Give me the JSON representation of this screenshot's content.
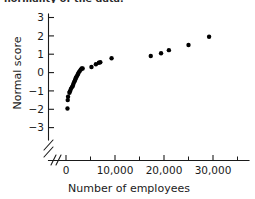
{
  "caption_fragment": "normality of the data.",
  "chart_data": {
    "type": "scatter",
    "title": "",
    "xlabel": "Number of employees",
    "ylabel": "Normal score",
    "xlim": [
      0,
      32000
    ],
    "ylim": [
      -3.6,
      3.4
    ],
    "grid": false,
    "legend": null,
    "axis_break_x": true,
    "axis_break_y": true,
    "x_ticks": [
      0,
      10000,
      20000,
      30000
    ],
    "x_ticklabels": [
      "0",
      "10,000",
      "20,000",
      "30,000"
    ],
    "x_minor_ticks": [
      5000,
      15000,
      25000
    ],
    "y_ticks": [
      -3,
      -2,
      -1,
      0,
      1,
      2,
      3
    ],
    "y_ticklabels": [
      "−3",
      "−2",
      "−1",
      "0",
      "1",
      "2",
      "3"
    ],
    "marker": "filled-circle",
    "marker_color": "#000000",
    "points": [
      {
        "x": 300,
        "y": -1.96
      },
      {
        "x": 350,
        "y": -1.5
      },
      {
        "x": 420,
        "y": -1.32
      },
      {
        "x": 700,
        "y": -1.1
      },
      {
        "x": 800,
        "y": -1.02
      },
      {
        "x": 1000,
        "y": -0.9
      },
      {
        "x": 1200,
        "y": -0.8
      },
      {
        "x": 1400,
        "y": -0.72
      },
      {
        "x": 1500,
        "y": -0.62
      },
      {
        "x": 1650,
        "y": -0.52
      },
      {
        "x": 1800,
        "y": -0.45
      },
      {
        "x": 1900,
        "y": -0.38
      },
      {
        "x": 2000,
        "y": -0.3
      },
      {
        "x": 2150,
        "y": -0.23
      },
      {
        "x": 2300,
        "y": -0.16
      },
      {
        "x": 2450,
        "y": -0.08
      },
      {
        "x": 2600,
        "y": 0.0
      },
      {
        "x": 2800,
        "y": 0.08
      },
      {
        "x": 3000,
        "y": 0.16
      },
      {
        "x": 3200,
        "y": 0.22
      },
      {
        "x": 3400,
        "y": 0.22
      },
      {
        "x": 5200,
        "y": 0.3
      },
      {
        "x": 6100,
        "y": 0.45
      },
      {
        "x": 6700,
        "y": 0.53
      },
      {
        "x": 7000,
        "y": 0.56
      },
      {
        "x": 9300,
        "y": 0.78
      },
      {
        "x": 17300,
        "y": 0.9
      },
      {
        "x": 19400,
        "y": 1.05
      },
      {
        "x": 21000,
        "y": 1.22
      },
      {
        "x": 25000,
        "y": 1.5
      },
      {
        "x": 29200,
        "y": 1.95
      }
    ]
  }
}
